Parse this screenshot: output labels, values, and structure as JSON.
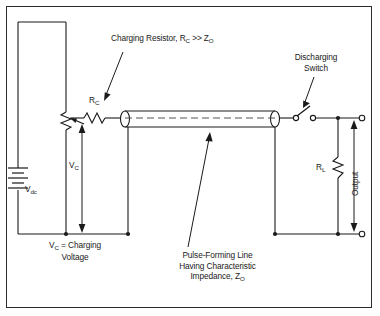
{
  "figure": {
    "type": "circuit-diagram",
    "frame": {
      "border_color": "#2b2b2b",
      "background": "#ffffff"
    }
  },
  "labels": {
    "charging_resistor": {
      "text_main": "Charging Resistor, R",
      "sub1": "C",
      "text_mid": " >> Z",
      "sub2": "O"
    },
    "rc": {
      "text": "R",
      "sub": "C"
    },
    "vdc": {
      "text": "V",
      "sub": "dc"
    },
    "vc_arrow": {
      "text": "V",
      "sub": "C"
    },
    "vc_caption_line1_a": "V",
    "vc_caption_line1_sub": "C",
    "vc_caption_line1_b": " =  Charging",
    "vc_caption_line2": "Voltage",
    "pulse_line": {
      "line1": "Pulse-Forming Line",
      "line2": "Having Characteristic",
      "line3_a": "Impedance, Z",
      "line3_sub": "O"
    },
    "discharging_switch": {
      "line1": "Discharging",
      "line2": "Switch"
    },
    "rl": {
      "text": "R",
      "sub": "L"
    },
    "output": {
      "text": "Output"
    }
  },
  "components": {
    "battery": "battery-vdc",
    "potentiometer": "variable-resistor",
    "charging_resistor": "resistor-rc",
    "transmission_line": "coaxial-pulse-forming-line",
    "switch": "discharging-switch-open",
    "load_resistor": "resistor-rl",
    "output_terminals": "output-terminal-pair"
  },
  "colors": {
    "wire": "#1a1a1a",
    "text": "#1a1a1a",
    "frame": "#2b2b2b",
    "background": "#ffffff",
    "dashed_conductor": "#555555"
  }
}
